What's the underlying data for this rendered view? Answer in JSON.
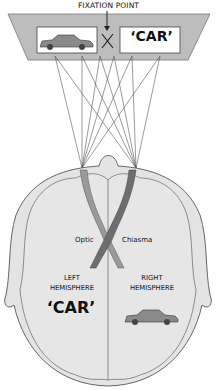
{
  "diagram": {
    "type": "optic-chiasma-visual-field",
    "labels": {
      "fixation_point": "FIXATION POINT",
      "word_visual_field": "‘CAR’",
      "optic": "Optic",
      "chiasma": "Chiasma",
      "left_hemisphere": "LEFT\nHEMISPHERE",
      "right_hemisphere": "RIGHT\nHEMISPHERE",
      "word_left_hemisphere": "‘CAR’"
    },
    "elements": {
      "visual_field_left_image": "car-picture",
      "visual_field_center": "fixation-cross",
      "visual_field_right_image": "word-car",
      "right_hemisphere_image": "car-picture"
    },
    "colors": {
      "screen_fill": "#bdbdbd",
      "brain_fill": "#e4e4e4",
      "outline": "#555555",
      "tract_left": "#6e6e6e",
      "tract_right": "#9a9a9a",
      "text": "#111111"
    }
  }
}
